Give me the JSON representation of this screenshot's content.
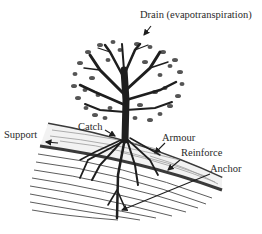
{
  "diagram": {
    "type": "illustration",
    "labels": [
      {
        "id": "drain",
        "text": "Drain (evapotranspiration)"
      },
      {
        "id": "support",
        "text": "Support"
      },
      {
        "id": "catch",
        "text": "Catch"
      },
      {
        "id": "armour",
        "text": "Armour"
      },
      {
        "id": "reinforce",
        "text": "Reinforce"
      },
      {
        "id": "anchor",
        "text": "Anchor"
      }
    ],
    "colors": {
      "ink": "#2a2a2a",
      "tree": "#1e1e1e",
      "leaf": "#555555",
      "soil_line": "#3a3a3a",
      "background": "#ffffff"
    }
  }
}
